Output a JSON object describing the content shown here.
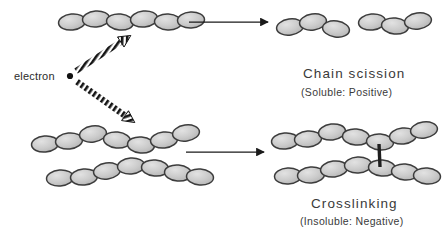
{
  "figure": {
    "type": "process-diagram",
    "background_color": "#ffffff"
  },
  "labels": {
    "electron": "electron",
    "chain_scission_title": "Chain  scission",
    "chain_scission_sub": "(Soluble:  Positive)",
    "crosslinking_title": "Crosslinking",
    "crosslinking_sub": "(Insoluble:  Negative)"
  },
  "colors": {
    "monomer_fill": "#c4c4c4",
    "monomer_fill_light": "#dcdcdc",
    "monomer_stroke": "#3c3c3c",
    "arrow": "#1a1a1a",
    "beam": "#1a1a1a",
    "text": "#3a3a3a",
    "crosslink_bond": "#1f1f1f"
  },
  "geometry": {
    "width": 442,
    "height": 232,
    "monomer_rx": 13.5,
    "monomer_ry": 8.0
  },
  "structures": {
    "reactant_top": {
      "name": "intact-polymer-chain",
      "monomer_count": 6,
      "monomers": [
        {
          "cx": 72,
          "cy": 22,
          "rot": -6
        },
        {
          "cx": 96,
          "cy": 19,
          "rot": -4
        },
        {
          "cx": 120,
          "cy": 22,
          "rot": 6
        },
        {
          "cx": 144,
          "cy": 19,
          "rot": -6
        },
        {
          "cx": 168,
          "cy": 22,
          "rot": 3
        },
        {
          "cx": 191,
          "cy": 20,
          "rot": -3
        }
      ]
    },
    "reactant_bottom_upper": {
      "name": "polymer-chain-upper",
      "monomer_count": 7,
      "monomers": [
        {
          "cx": 45,
          "cy": 144,
          "rot": -5
        },
        {
          "cx": 69,
          "cy": 141,
          "rot": -6
        },
        {
          "cx": 93,
          "cy": 134,
          "rot": -8
        },
        {
          "cx": 117,
          "cy": 140,
          "rot": 6
        },
        {
          "cx": 141,
          "cy": 145,
          "rot": 5
        },
        {
          "cx": 164,
          "cy": 140,
          "rot": -6
        },
        {
          "cx": 186,
          "cy": 133,
          "rot": -8
        }
      ]
    },
    "reactant_bottom_lower": {
      "name": "polymer-chain-lower",
      "monomer_count": 7,
      "monomers": [
        {
          "cx": 60,
          "cy": 178,
          "rot": -4
        },
        {
          "cx": 84,
          "cy": 177,
          "rot": -5
        },
        {
          "cx": 107,
          "cy": 171,
          "rot": -8
        },
        {
          "cx": 131,
          "cy": 166,
          "rot": -4
        },
        {
          "cx": 155,
          "cy": 168,
          "rot": 5
        },
        {
          "cx": 178,
          "cy": 173,
          "rot": 5
        },
        {
          "cx": 200,
          "cy": 177,
          "rot": 4
        }
      ]
    },
    "product_scission_left": {
      "name": "scission-fragment-left",
      "monomer_count": 3,
      "monomers": [
        {
          "cx": 290,
          "cy": 27,
          "rot": -8
        },
        {
          "cx": 313,
          "cy": 22,
          "rot": -8
        },
        {
          "cx": 336,
          "cy": 29,
          "rot": 8
        }
      ]
    },
    "product_scission_right": {
      "name": "scission-fragment-right",
      "monomer_count": 3,
      "monomers": [
        {
          "cx": 372,
          "cy": 22,
          "rot": -6
        },
        {
          "cx": 395,
          "cy": 26,
          "rot": 6
        },
        {
          "cx": 418,
          "cy": 21,
          "rot": -8
        }
      ]
    },
    "product_crosslink_upper": {
      "name": "crosslinked-chain-upper",
      "monomer_count": 7,
      "monomers": [
        {
          "cx": 285,
          "cy": 141,
          "rot": -5
        },
        {
          "cx": 308,
          "cy": 139,
          "rot": -4
        },
        {
          "cx": 332,
          "cy": 132,
          "rot": -7
        },
        {
          "cx": 356,
          "cy": 137,
          "rot": 5
        },
        {
          "cx": 380,
          "cy": 142,
          "rot": 4
        },
        {
          "cx": 403,
          "cy": 136,
          "rot": -6
        },
        {
          "cx": 424,
          "cy": 130,
          "rot": -8
        }
      ]
    },
    "product_crosslink_lower": {
      "name": "crosslinked-chain-lower",
      "monomer_count": 7,
      "monomers": [
        {
          "cx": 288,
          "cy": 176,
          "rot": -3
        },
        {
          "cx": 311,
          "cy": 175,
          "rot": -4
        },
        {
          "cx": 334,
          "cy": 169,
          "rot": -7
        },
        {
          "cx": 358,
          "cy": 165,
          "rot": -3
        },
        {
          "cx": 382,
          "cy": 168,
          "rot": 5
        },
        {
          "cx": 405,
          "cy": 172,
          "rot": 4
        },
        {
          "cx": 427,
          "cy": 176,
          "rot": 4
        }
      ]
    },
    "crosslink_bond": {
      "name": "crosslink-bond",
      "x1": 379,
      "y1": 144,
      "x2": 380,
      "y2": 167,
      "width": 3.4
    }
  },
  "beams": [
    {
      "name": "electron-beam-up",
      "x1": 76,
      "y1": 71,
      "x2": 130,
      "y2": 36
    },
    {
      "name": "electron-beam-down",
      "x1": 76,
      "y1": 81,
      "x2": 134,
      "y2": 122
    }
  ],
  "reaction_arrows": [
    {
      "name": "reaction-arrow-top",
      "x1": 189,
      "y1": 22,
      "x2": 268,
      "y2": 22
    },
    {
      "name": "reaction-arrow-bottom",
      "x1": 186,
      "y1": 152,
      "x2": 264,
      "y2": 152
    }
  ],
  "electron_source": {
    "name": "electron-point",
    "cx": 70,
    "cy": 76,
    "r": 3.1
  },
  "caption_positions": {
    "chain_scission_title": {
      "left": 303,
      "top": 66
    },
    "chain_scission_sub": {
      "left": 301,
      "top": 86
    },
    "crosslinking_title": {
      "left": 311,
      "top": 196
    },
    "crosslinking_sub": {
      "left": 300,
      "top": 215
    },
    "electron_label": {
      "left": 14,
      "top": 70
    }
  }
}
